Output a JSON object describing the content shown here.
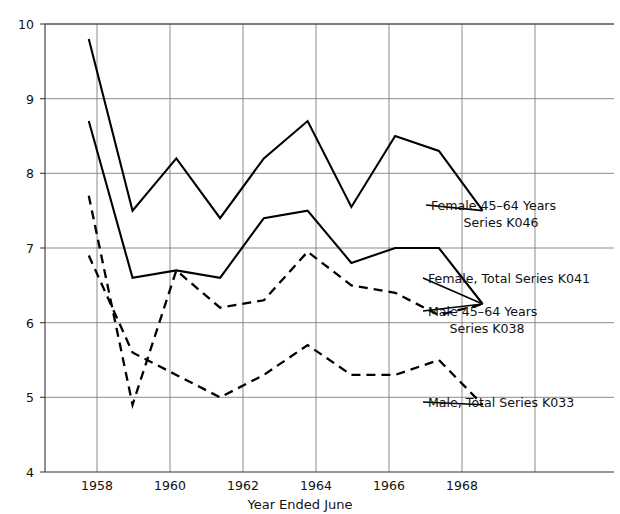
{
  "chart_data": {
    "type": "line",
    "title": "",
    "subtitle": "",
    "xlabel": "Year Ended June",
    "ylabel": "",
    "xlim": [
      1957.0,
      1970.0
    ],
    "ylim": [
      4,
      10
    ],
    "grid": true,
    "legend_position": "inline-right-annotations",
    "x_ticks": [
      1958,
      1960,
      1962,
      1964,
      1966,
      1968
    ],
    "x_tick_labels": [
      "1958",
      "1960",
      "1962",
      "1964",
      "1966",
      "1968"
    ],
    "y_ticks": [
      4,
      5,
      6,
      7,
      8,
      9,
      10
    ],
    "y_tick_labels": [
      "4",
      "5",
      "6",
      "7",
      "8",
      "9",
      "10"
    ],
    "x": [
      1958,
      1959,
      1960,
      1961,
      1962,
      1963,
      1964,
      1965,
      1966,
      1967
    ],
    "series": [
      {
        "name": "Female 45–64 Years Series K046",
        "short_name": "K046",
        "style": "solid",
        "color": "#000000",
        "values": [
          9.8,
          7.5,
          8.2,
          7.4,
          8.2,
          8.7,
          7.55,
          8.5,
          8.3,
          7.5
        ]
      },
      {
        "name": "Female, Total Series K041",
        "short_name": "K041",
        "style": "solid",
        "color": "#000000",
        "values": [
          8.7,
          6.6,
          6.7,
          6.6,
          7.4,
          7.5,
          6.8,
          7.0,
          7.0,
          6.25
        ]
      },
      {
        "name": "Male 45–64 Years Series K038",
        "short_name": "K038",
        "style": "dashed",
        "color": "#000000",
        "values": [
          7.7,
          4.9,
          6.7,
          6.2,
          6.3,
          6.95,
          6.5,
          6.4,
          6.1,
          6.25
        ]
      },
      {
        "name": "Male, Total Series K033",
        "short_name": "K033",
        "style": "dashed",
        "color": "#000000",
        "values": [
          6.9,
          5.6,
          5.3,
          5.0,
          5.3,
          5.7,
          5.3,
          5.3,
          5.5,
          4.9
        ]
      }
    ],
    "annotations": [
      {
        "id": "k046",
        "lines": [
          "Female 45–64 Years",
          "Series K046"
        ],
        "anchor_value": 7.5,
        "anchor_year": 1967
      },
      {
        "id": "k041",
        "lines": [
          "Female, Total Series K041"
        ],
        "anchor_value": 6.25,
        "anchor_year": 1967
      },
      {
        "id": "k038",
        "lines": [
          "Male 45–64 Years",
          "Series K038"
        ],
        "anchor_value": 6.25,
        "anchor_year": 1967
      },
      {
        "id": "k033",
        "lines": [
          "Male, Total Series K033"
        ],
        "anchor_value": 4.9,
        "anchor_year": 1967
      }
    ]
  },
  "axes": {
    "x_title": "Year Ended June",
    "y_title": ""
  },
  "labels": {
    "y": [
      "10",
      "9",
      "8",
      "7",
      "6",
      "5",
      "4"
    ],
    "x": [
      "1958",
      "1960",
      "1962",
      "1964",
      "1966",
      "1968"
    ],
    "annot_k046_line1": "Female 45–64 Years",
    "annot_k046_line2": "Series K046",
    "annot_k041_line1": "Female, Total Series K041",
    "annot_k038_line1": "Male 45–64 Years",
    "annot_k038_line2": "Series K038",
    "annot_k033_line1": "Male, Total Series K033"
  },
  "colors": {
    "line": "#000000",
    "grid": "#6f6f6f",
    "axis": "#333333",
    "background": "#ffffff",
    "text": "#111111"
  }
}
